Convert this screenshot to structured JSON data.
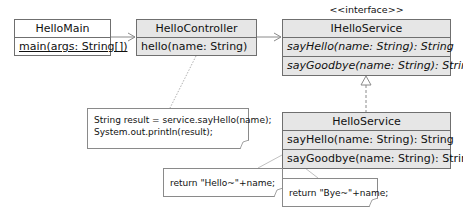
{
  "diagram": {
    "classes": {
      "hello_main": {
        "name": "HelloMain",
        "operations": [
          "main(args: String[])"
        ]
      },
      "hello_controller": {
        "name": "HelloController",
        "operations": [
          "hello(name: String)"
        ]
      },
      "ihello_service": {
        "stereotype": "<<interface>>",
        "name": "IHelloService",
        "operations": [
          "sayHello(name: String): String",
          "sayGoodbye(name: String): String"
        ]
      },
      "hello_service": {
        "name": "HelloService",
        "operations": [
          "sayHello(name: String): String",
          "sayGoodbye(name: String): String"
        ]
      }
    },
    "notes": {
      "controller_note": {
        "lines": [
          "String result = service.sayHello(name);",
          "System.out.println(result);"
        ]
      },
      "say_hello_note": {
        "lines": [
          "return \"Hello~\"+name;"
        ]
      },
      "say_goodbye_note": {
        "lines": [
          "return \"Bye~\"+name;"
        ]
      }
    },
    "relations": [
      {
        "from": "HelloMain",
        "to": "HelloController",
        "type": "dependency"
      },
      {
        "from": "HelloController",
        "to": "IHelloService",
        "type": "dependency"
      },
      {
        "from": "HelloService",
        "to": "IHelloService",
        "type": "realization"
      }
    ],
    "colors": {
      "class_fill": "#e6e6e6",
      "border": "#6f6f6f",
      "background": "#ffffff"
    }
  }
}
